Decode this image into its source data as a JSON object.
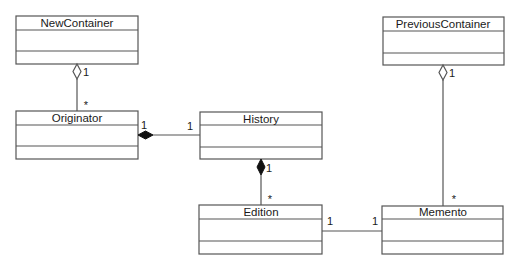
{
  "diagram": {
    "type": "UML class diagram",
    "classes": {
      "new_container": {
        "name": "NewContainer"
      },
      "originator": {
        "name": "Originator"
      },
      "history": {
        "name": "History"
      },
      "edition": {
        "name": "Edition"
      },
      "previous_container": {
        "name": "PreviousContainer"
      },
      "memento": {
        "name": "Memento"
      }
    },
    "associations": {
      "newcontainer_originator": {
        "kind": "aggregation",
        "whole": "NewContainer",
        "part": "Originator",
        "whole_mult": "1",
        "part_mult": "*"
      },
      "originator_history": {
        "kind": "composition",
        "whole": "Originator",
        "part": "History",
        "whole_mult": "1",
        "part_mult": "1"
      },
      "history_edition": {
        "kind": "composition",
        "whole": "History",
        "part": "Edition",
        "whole_mult": "1",
        "part_mult": "*"
      },
      "edition_memento": {
        "kind": "association",
        "a": "Edition",
        "b": "Memento",
        "a_mult": "1",
        "b_mult": "1"
      },
      "previouscontainer_memento": {
        "kind": "aggregation",
        "whole": "PreviousContainer",
        "part": "Memento",
        "whole_mult": "1",
        "part_mult": "*"
      }
    },
    "colors": {
      "line": "#555555",
      "text": "#1a1a1a",
      "background": "#ffffff"
    }
  }
}
